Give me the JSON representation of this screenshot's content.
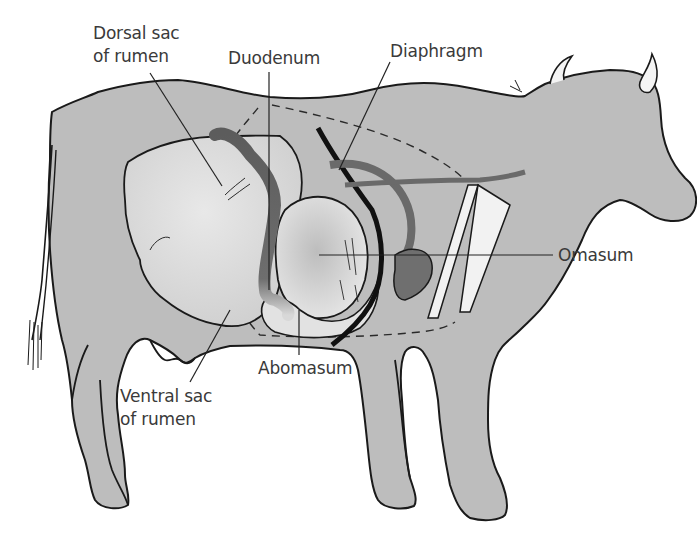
{
  "diagram": {
    "colors": {
      "body": "#b9b9b9",
      "rumen": "#dedede",
      "omasum": "#d2d2d2",
      "duodenum": "#6a6a6a",
      "outline": "#1a1a1a",
      "label_text": "#3a3a3a",
      "background": "#ffffff"
    },
    "labels": [
      {
        "id": "dorsal-sac",
        "text": "Dorsal sac\nof rumen",
        "x": 93,
        "y": 22,
        "pointer_to": [
          222,
          186
        ]
      },
      {
        "id": "duodenum",
        "text": "Duodenum",
        "x": 228,
        "y": 47,
        "pointer_to": [
          269,
          290
        ]
      },
      {
        "id": "diaphragm",
        "text": "Diaphragm",
        "x": 390,
        "y": 40,
        "pointer_to": [
          339,
          170
        ]
      },
      {
        "id": "omasum",
        "text": "Omasum",
        "x": 558,
        "y": 244,
        "pointer_to": [
          319,
          255
        ]
      },
      {
        "id": "abomasum",
        "text": "Abomasum",
        "x": 258,
        "y": 357,
        "pointer_to": [
          299,
          310
        ]
      },
      {
        "id": "ventral-sac",
        "text": "Ventral sac\nof rumen",
        "x": 120,
        "y": 385,
        "pointer_to": [
          230,
          310
        ]
      }
    ]
  }
}
